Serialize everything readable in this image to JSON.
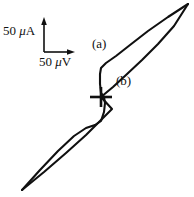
{
  "figure": {
    "background_color": "#ffffff",
    "line_color": "#101010",
    "width": 194,
    "height": 197
  },
  "axes_key": {
    "vertical_label": "50 μA",
    "vertical_label_prefix": "50 ",
    "vertical_label_unit": "μ",
    "vertical_label_suffix": "A",
    "horizontal_label": "50 μV",
    "horizontal_label_prefix": "50 ",
    "horizontal_label_unit": "μ",
    "horizontal_label_suffix": "V",
    "corner_x": 44,
    "corner_y": 52,
    "vertical_arrow_top_y": 18,
    "horizontal_arrow_right_x": 75
  },
  "annotations": {
    "branch_a": "(a)",
    "branch_b": "(b)"
  },
  "origin_marker": {
    "name": "origin-cross",
    "center_x": 101,
    "center_y": 97,
    "half_width": 11,
    "half_height": 10
  },
  "chart_data": {
    "type": "line",
    "title": "",
    "xlabel": "50 μV",
    "ylabel": "50 μA",
    "grid": false,
    "legend": [
      "(a)",
      "(b)"
    ],
    "axis_scale_note": "Scale key only: vertical tick = 50 microamperes, horizontal tick = 50 microvolts",
    "origin_marker": [
      101,
      97
    ],
    "series": [
      {
        "name": "(a)",
        "note": "upper/forward sweep branch of the hysteretic I-V curve",
        "points": [
          [
            22,
            190
          ],
          [
            40,
            170
          ],
          [
            58,
            151
          ],
          [
            74,
            136
          ],
          [
            86,
            128
          ],
          [
            95,
            125
          ],
          [
            101,
            121
          ],
          [
            104,
            112
          ],
          [
            105,
            103
          ],
          [
            104,
            97
          ],
          [
            101,
            93
          ],
          [
            100,
            84
          ],
          [
            100,
            74
          ],
          [
            101,
            68
          ],
          [
            106,
            63
          ],
          [
            116,
            56
          ],
          [
            130,
            45
          ],
          [
            148,
            31
          ],
          [
            168,
            17
          ],
          [
            188,
            4
          ]
        ]
      },
      {
        "name": "(b)",
        "note": "lower/return sweep branch of the hysteretic I-V curve",
        "points": [
          [
            22,
            190
          ],
          [
            44,
            172
          ],
          [
            66,
            153
          ],
          [
            86,
            135
          ],
          [
            101,
            120
          ],
          [
            112,
            109
          ],
          [
            101,
            97
          ],
          [
            113,
            87
          ],
          [
            126,
            75
          ],
          [
            142,
            60
          ],
          [
            158,
            44
          ],
          [
            174,
            26
          ],
          [
            188,
            4
          ]
        ]
      }
    ]
  }
}
